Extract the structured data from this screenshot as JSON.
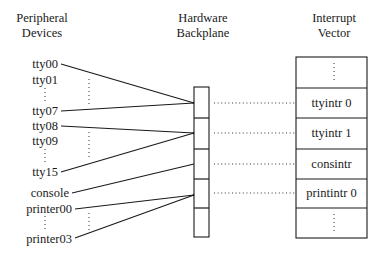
{
  "headers": {
    "devices": [
      "Peripheral",
      "Devices"
    ],
    "backplane": [
      "Hardware",
      "Backplane"
    ],
    "vector": [
      "Interrupt",
      "Vector"
    ]
  },
  "devices": [
    {
      "label": "tty00",
      "slot": 0
    },
    {
      "label": "tty01",
      "slot": 0
    },
    {
      "label": "tty07",
      "slot": 0
    },
    {
      "label": "tty08",
      "slot": 1
    },
    {
      "label": "tty09",
      "slot": 1
    },
    {
      "label": "tty15",
      "slot": 1
    },
    {
      "label": "console",
      "slot": 2
    },
    {
      "label": "printer00",
      "slot": 3
    },
    {
      "label": "printer03",
      "slot": 3
    }
  ],
  "backplane_slots": 5,
  "interrupt_vector": [
    {
      "label": "⋮"
    },
    {
      "label": "ttyintr 0"
    },
    {
      "label": "ttyintr 1"
    },
    {
      "label": "consintr"
    },
    {
      "label": "printintr 0"
    },
    {
      "label": "⋮"
    }
  ],
  "ellipsis": "⋮"
}
